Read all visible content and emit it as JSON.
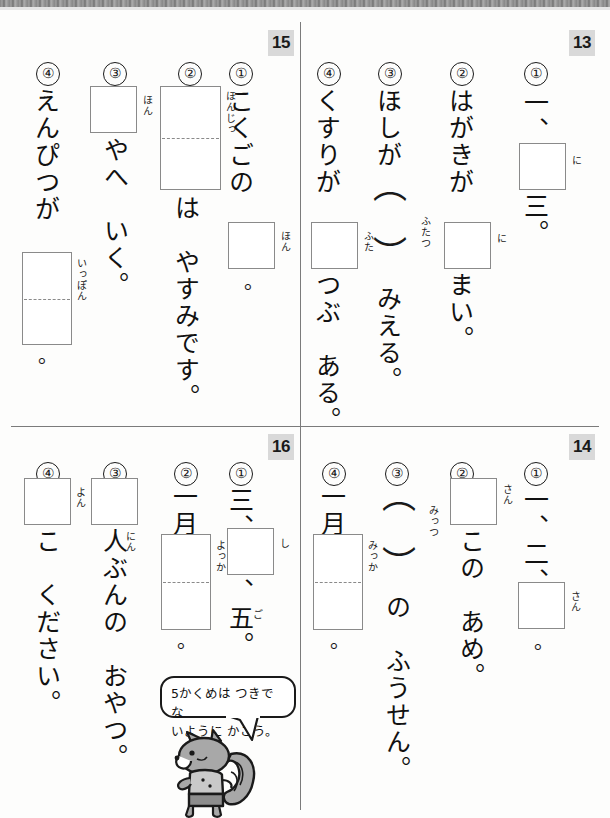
{
  "page": {
    "background_color": "#fdfdfc",
    "rule_color": "#7b7b7b"
  },
  "sections": [
    {
      "id": "sec-13",
      "number": "13",
      "position": "top-right",
      "questions": [
        {
          "marker": "①",
          "text_before": "一、",
          "box": {
            "type": "single"
          },
          "furigana": "に",
          "text_after": "三。"
        },
        {
          "marker": "②",
          "text_before": "はがきが",
          "box": {
            "type": "single"
          },
          "furigana": "に",
          "text_after": "まい。"
        },
        {
          "marker": "③",
          "text_before": "ほしが",
          "box": {
            "type": "paren"
          },
          "furigana": "ふたつ",
          "text_after": "みえる。"
        },
        {
          "marker": "④",
          "text_before": "くすりが",
          "box": {
            "type": "single"
          },
          "furigana": "ふた",
          "text_after": "つぶ　ある。"
        }
      ]
    },
    {
      "id": "sec-15",
      "number": "15",
      "position": "top-left",
      "questions": [
        {
          "marker": "①",
          "text_before": "こくごの",
          "box": {
            "type": "single"
          },
          "furigana": "ほん",
          "text_after": "。"
        },
        {
          "marker": "②",
          "text_before": "",
          "box": {
            "type": "tall-dashed"
          },
          "furigana": "ほんじっ",
          "text_after": "は　やすみです。"
        },
        {
          "marker": "③",
          "text_before": "",
          "box": {
            "type": "single"
          },
          "furigana": "ほん",
          "text_after": "やへ　いく。"
        },
        {
          "marker": "④",
          "text_before": "えんぴつが",
          "box": {
            "type": "tall-dashed"
          },
          "furigana": "いっぽん",
          "text_after": "。"
        }
      ]
    },
    {
      "id": "sec-14",
      "number": "14",
      "position": "bottom-right",
      "questions": [
        {
          "marker": "①",
          "text_before": "一、二、",
          "box": {
            "type": "single"
          },
          "furigana": "さん",
          "text_after": "。"
        },
        {
          "marker": "②",
          "text_before": "",
          "box": {
            "type": "single"
          },
          "furigana": "さん",
          "text_after": "この　あめ。"
        },
        {
          "marker": "③",
          "text_before": "",
          "box": {
            "type": "paren"
          },
          "furigana": "みっつ",
          "text_after": "の　ふうせん。"
        },
        {
          "marker": "④",
          "text_before": "一月",
          "box": {
            "type": "tall-dashed"
          },
          "furigana": "みっか",
          "text_after": "。"
        }
      ]
    },
    {
      "id": "sec-16",
      "number": "16",
      "position": "bottom-left",
      "questions": [
        {
          "marker": "①",
          "text_before": "三、",
          "box": {
            "type": "single"
          },
          "furigana": "し",
          "text_after": "、五。",
          "furigana2": "ご"
        },
        {
          "marker": "②",
          "text_before": "一月",
          "box": {
            "type": "tall-dashed"
          },
          "furigana": "よっか",
          "text_after": "。"
        },
        {
          "marker": "③",
          "text_before": "",
          "box": {
            "type": "single"
          },
          "furigana": "",
          "text_after": "人ぶんの　おやつ。",
          "furigana2": "にん"
        },
        {
          "marker": "④",
          "text_before": "",
          "box": {
            "type": "single"
          },
          "furigana": "よん",
          "text_after": "こ　ください。"
        }
      ]
    }
  ],
  "hint": {
    "bubble_text": "5かくめは つきでな\nいように かこう。",
    "character": "squirrel-mascot"
  }
}
